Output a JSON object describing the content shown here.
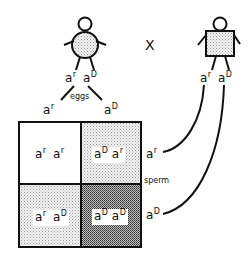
{
  "diagram": {
    "type": "punnett-square",
    "cross_symbol": "X",
    "female": {
      "shape": "circle-body",
      "genotype": [
        {
          "base": "a",
          "sup": "r"
        },
        {
          "base": "a",
          "sup": "D"
        }
      ],
      "gametes_label": "eggs",
      "gametes": [
        {
          "base": "a",
          "sup": "r"
        },
        {
          "base": "a",
          "sup": "D"
        }
      ]
    },
    "male": {
      "shape": "square-body",
      "genotype": [
        {
          "base": "a",
          "sup": "r"
        },
        {
          "base": "a",
          "sup": "D"
        }
      ],
      "gametes_label": "sperm",
      "gametes": [
        {
          "base": "a",
          "sup": "r"
        },
        {
          "base": "a",
          "sup": "D"
        }
      ]
    },
    "cells": [
      {
        "pos": "top-left",
        "alleles": [
          {
            "base": "a",
            "sup": "r"
          },
          {
            "base": "a",
            "sup": "r"
          }
        ],
        "shading": "none"
      },
      {
        "pos": "top-right",
        "alleles": [
          {
            "base": "a",
            "sup": "D"
          },
          {
            "base": "a",
            "sup": "r"
          }
        ],
        "shading": "light"
      },
      {
        "pos": "bottom-left",
        "alleles": [
          {
            "base": "a",
            "sup": "r"
          },
          {
            "base": "a",
            "sup": "D"
          }
        ],
        "shading": "light"
      },
      {
        "pos": "bottom-right",
        "alleles": [
          {
            "base": "a",
            "sup": "D"
          },
          {
            "base": "a",
            "sup": "D"
          }
        ],
        "shading": "dark"
      }
    ],
    "colors": {
      "ink": "#111111",
      "light_shade": "#d6d6d6",
      "dark_shade": "#8a8a8a",
      "background": "#ffffff"
    }
  }
}
